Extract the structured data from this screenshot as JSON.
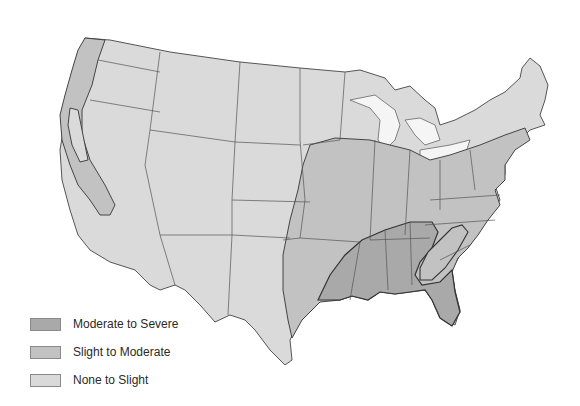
{
  "map": {
    "colors": {
      "moderate_to_severe": "#a9a9a9",
      "slight_to_moderate": "#c2c2c2",
      "none_to_slight": "#dadada",
      "borders": "#555555",
      "water": "#ffffff"
    }
  },
  "legend": {
    "items": [
      {
        "label": "Moderate to Severe",
        "color": "#a9a9a9"
      },
      {
        "label": "Slight to Moderate",
        "color": "#c2c2c2"
      },
      {
        "label": "None to Slight",
        "color": "#dadada"
      }
    ]
  }
}
